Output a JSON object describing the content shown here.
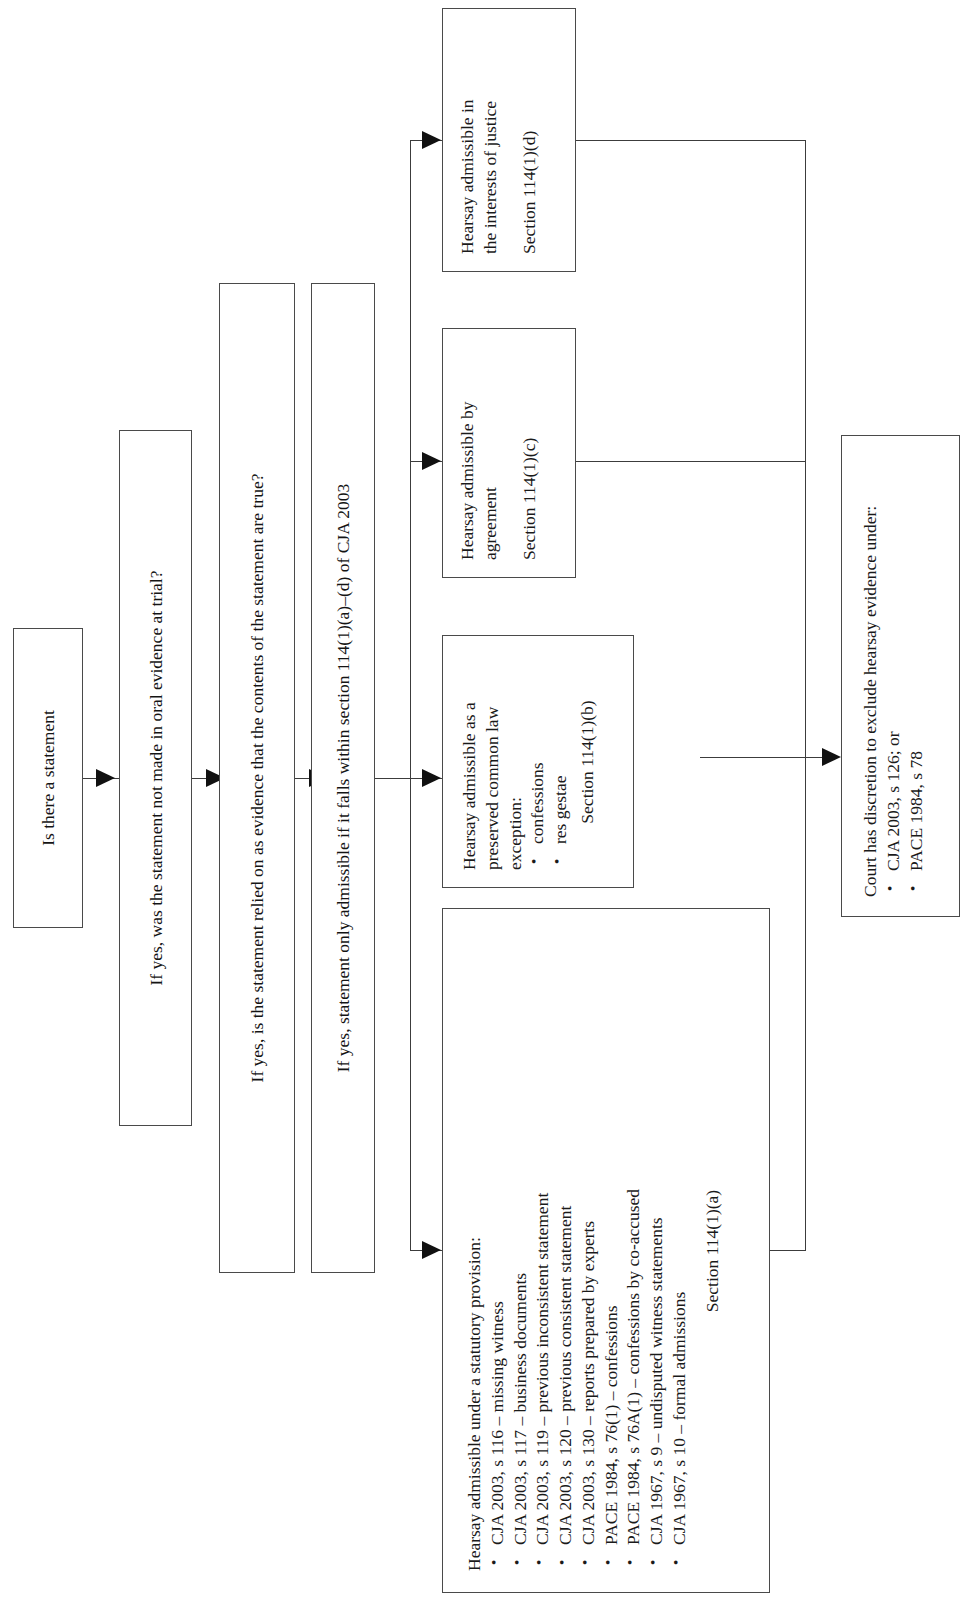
{
  "diagram": {
    "orientation": "rotated-90-ccw",
    "ink_color": "#141414",
    "border_color": "#4a4a4a",
    "background": "#ffffff"
  },
  "nodes": {
    "step1": {
      "label": "Is there a statement"
    },
    "step2": {
      "label": "If yes, was the statement not made in oral evidence at trial?"
    },
    "step3": {
      "label": "If yes, is the statement relied on as evidence that the contents of the statement are true?"
    },
    "step4": {
      "label": "If yes, statement only admissible if it falls within section 114(1)(a)–(d) of CJA 2003"
    },
    "branch_a": {
      "lead": "Hearsay admissible under a statutory provision:",
      "bullets": [
        "CJA 2003, s 116 – missing witness",
        "CJA 2003, s 117 – business documents",
        "CJA 2003, s 119 – previous inconsistent statement",
        "CJA 2003, s 120 – previous consistent statement",
        "CJA 2003, s 130 – reports prepared by experts",
        "PACE 1984, s 76(1) – confessions",
        "PACE 1984, s 76A(1) – confessions by co-accused",
        "CJA 1967, s 9 – undisputed witness statements",
        "CJA 1967, s 10 – formal admissions"
      ],
      "reference": "Section 114(1)(a)"
    },
    "branch_b": {
      "lead": "Hearsay admissible as a preserved common law exception:",
      "bullets": [
        "confessions",
        "res gestae"
      ],
      "reference": "Section 114(1)(b)"
    },
    "branch_c": {
      "line1": "Hearsay admissible by",
      "line2": "agreement",
      "reference": "Section 114(1)(c)"
    },
    "branch_d": {
      "line1": "Hearsay admissible in",
      "line2": "the interests of justice",
      "reference": "Section 114(1)(d)"
    },
    "outcome": {
      "lead": "Court has discretion to exclude hearsay evidence under:",
      "bullets": [
        "CJA 2003, s 126; or",
        "PACE 1984, s 78"
      ]
    }
  }
}
